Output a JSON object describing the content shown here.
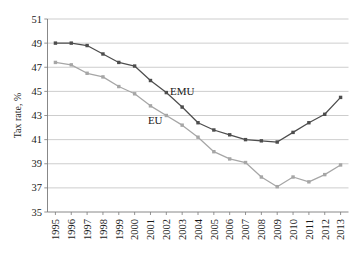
{
  "chart_data": {
    "type": "line",
    "title": "",
    "xlabel": "",
    "ylabel": "Tax rate, %",
    "categories": [
      "1995",
      "1996",
      "1997",
      "1998",
      "1999",
      "2000",
      "2001",
      "2002",
      "2003",
      "2004",
      "2005",
      "2006",
      "2007",
      "2008",
      "2009",
      "2010",
      "2011",
      "2012",
      "2013"
    ],
    "ylim": [
      35,
      51
    ],
    "yticks": [
      35,
      37,
      39,
      41,
      43,
      45,
      47,
      49,
      51
    ],
    "grid": true,
    "legend_position": "inline-annotations",
    "series": [
      {
        "name": "EMU",
        "color": "#4d4d4d",
        "marker": "square",
        "values": [
          49.0,
          49.0,
          48.8,
          48.1,
          47.4,
          47.1,
          45.9,
          44.9,
          43.7,
          42.4,
          41.8,
          41.4,
          41.0,
          40.9,
          40.8,
          41.6,
          42.4,
          43.1,
          44.5
        ]
      },
      {
        "name": "EU",
        "color": "#a6a6a6",
        "marker": "square",
        "values": [
          47.4,
          47.2,
          46.5,
          46.2,
          45.4,
          44.8,
          43.8,
          43.0,
          42.2,
          41.2,
          40.0,
          39.4,
          39.1,
          37.9,
          37.1,
          37.9,
          37.5,
          38.1,
          38.9
        ]
      }
    ],
    "annotations": [
      {
        "text": "EMU",
        "x_value": 2003.0,
        "y_value": 44.7
      },
      {
        "text": "EU",
        "x_value": 2001.3,
        "y_value": 42.3
      }
    ]
  },
  "axes": {
    "y_axis_title": "Tax rate, %"
  }
}
